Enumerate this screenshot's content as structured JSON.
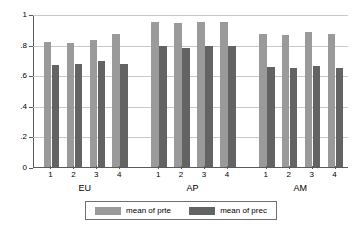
{
  "chart_data": {
    "type": "bar",
    "title": "",
    "subtitle": "",
    "xlabel": "",
    "ylabel": "",
    "ylim": [
      0,
      1
    ],
    "ytick_labels": [
      "0",
      ".2",
      ".4",
      ".6",
      ".8",
      "1"
    ],
    "ytick_values": [
      0,
      0.2,
      0.4,
      0.6,
      0.8,
      1
    ],
    "grid": true,
    "legend_position": "bottom",
    "groups": [
      "EU",
      "AP",
      "AM"
    ],
    "categories": [
      "1",
      "2",
      "3",
      "4"
    ],
    "series": [
      {
        "name": "mean of prte",
        "color": "#9a9a9a",
        "values_by_group": {
          "EU": [
            0.82,
            0.81,
            0.83,
            0.87
          ],
          "AP": [
            0.95,
            0.94,
            0.95,
            0.95
          ],
          "AM": [
            0.87,
            0.86,
            0.88,
            0.87
          ]
        }
      },
      {
        "name": "mean of prec",
        "color": "#636363",
        "values_by_group": {
          "EU": [
            0.665,
            0.675,
            0.69,
            0.675
          ],
          "AP": [
            0.79,
            0.78,
            0.79,
            0.79
          ],
          "AM": [
            0.655,
            0.65,
            0.66,
            0.65
          ]
        }
      }
    ]
  },
  "legend": {
    "entries": [
      {
        "label": "mean of prte",
        "color": "#9a9a9a"
      },
      {
        "label": "mean of prec",
        "color": "#636363"
      }
    ]
  },
  "axes": {
    "y": {
      "ticks": [
        {
          "label": "1",
          "value": 1
        },
        {
          "label": ".8",
          "value": 0.8
        },
        {
          "label": ".6",
          "value": 0.6
        },
        {
          "label": ".4",
          "value": 0.4
        },
        {
          "label": ".2",
          "value": 0.2
        },
        {
          "label": "0",
          "value": 0
        }
      ]
    },
    "x": {
      "group_labels": [
        "EU",
        "AP",
        "AM"
      ],
      "tick_labels": [
        "1",
        "2",
        "3",
        "4",
        "1",
        "2",
        "3",
        "4",
        "1",
        "2",
        "3",
        "4"
      ]
    }
  },
  "colors": {
    "series_a": "#9a9a9a",
    "series_b": "#636363",
    "gridline": "#c8c8c8",
    "axis": "#5a5a5a",
    "background": "#ffffff"
  }
}
